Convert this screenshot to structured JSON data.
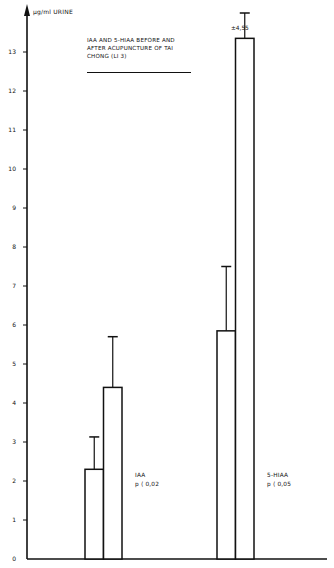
{
  "chart_data": {
    "type": "bar",
    "title": "IAA AND 5-HIAA BEFORE AND AFTER ACUPUNCTURE OF TAI CHONG (LI 3)",
    "title_lines": [
      "IAA AND 5-HIAA BEFORE AND",
      "AFTER ACUPUNCTURE OF TAI",
      "CHONG (LI 3)"
    ],
    "xlabel": "",
    "ylabel": "µg/ml URINE",
    "ylim": [
      0,
      13.6
    ],
    "yticks": [
      0,
      1,
      2,
      3,
      4,
      5,
      6,
      7,
      8,
      9,
      10,
      11,
      12,
      13
    ],
    "grid": false,
    "legend": "none",
    "categories": [
      "IAA",
      "5-HIAA"
    ],
    "series": [
      {
        "name": "Before acupuncture",
        "values": [
          2.3,
          5.85
        ],
        "error_upper": [
          3.13,
          7.5
        ]
      },
      {
        "name": "After acupuncture",
        "values": [
          4.4,
          13.35
        ],
        "error_upper": [
          5.7,
          14.0
        ]
      }
    ],
    "group_labels": [
      {
        "name": "IAA",
        "pvalue": "p < 0,02"
      },
      {
        "name": "5-HIAA",
        "pvalue": "p < 0,05"
      }
    ],
    "annotations": [
      {
        "text": "±4,55",
        "target": "5-HIAA after"
      }
    ]
  },
  "labels": {
    "ylabel": "µg/ml URINE",
    "title_1": "IAA AND 5-HIAA BEFORE AND",
    "title_2": "AFTER ACUPUNCTURE OF TAI",
    "title_3": "CHONG (LI 3)",
    "iaa_name": "IAA",
    "iaa_p": "p ⟨ 0,02",
    "hiaa_name": "5-HIAA",
    "hiaa_p": "p ⟨ 0,05",
    "sd_annot": "±4,55"
  },
  "ticks": [
    "0",
    "1",
    "2",
    "3",
    "4",
    "5",
    "6",
    "7",
    "8",
    "9",
    "10",
    "11",
    "12",
    "13"
  ]
}
